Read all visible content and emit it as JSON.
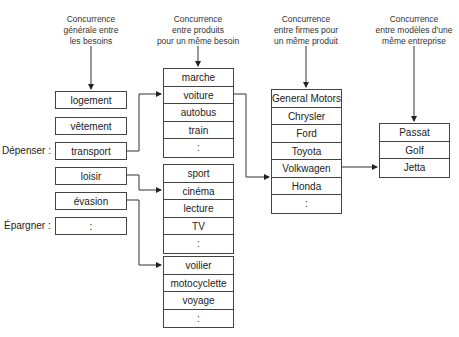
{
  "headers": {
    "needs": [
      "Concurrence",
      "générale entre",
      "les besoins"
    ],
    "products": [
      "Concurrence",
      "entre produits",
      "pour un même besoin"
    ],
    "firms": [
      "Concurrence",
      "entre firmes pour",
      "un même produit"
    ],
    "models": [
      "Concurrence",
      "entre modèles d'une",
      "même entreprise"
    ]
  },
  "side_labels": {
    "spend": "Dépenser :",
    "save": "Épargner :"
  },
  "needs": [
    "logement",
    "vêtement",
    "transport",
    "loisir",
    "évasion",
    ":"
  ],
  "product_groups": [
    [
      "marche",
      "voiture",
      "autobus",
      "train",
      ":"
    ],
    [
      "sport",
      "cinéma",
      "lecture",
      "TV",
      ":"
    ],
    [
      "voilier",
      "motocyclette",
      "voyage",
      ":"
    ]
  ],
  "firms": [
    "General Motors",
    "Chrysler",
    "Ford",
    "Toyota",
    "Volkwagen",
    "Honda",
    ":"
  ],
  "models": [
    "Passat",
    "Golf",
    "Jetta"
  ]
}
